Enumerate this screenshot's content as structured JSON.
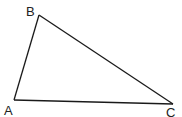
{
  "diagram": {
    "type": "triangle",
    "vertices": [
      {
        "label": "A",
        "x": 14,
        "y": 100,
        "label_x": 4,
        "label_y": 115
      },
      {
        "label": "B",
        "x": 39,
        "y": 15,
        "label_x": 26,
        "label_y": 16
      },
      {
        "label": "C",
        "x": 173,
        "y": 104,
        "label_x": 166,
        "label_y": 117
      }
    ],
    "edges": [
      [
        "A",
        "B"
      ],
      [
        "B",
        "C"
      ],
      [
        "C",
        "A"
      ]
    ],
    "colors": {
      "stroke": "#1a1a1a",
      "background": "#ffffff"
    }
  }
}
